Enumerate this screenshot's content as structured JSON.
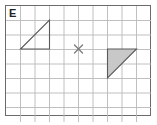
{
  "figure": {
    "label": "E",
    "background_color": "#ffffff",
    "border_color": "#6b6b6b",
    "grid_line_color": "#b9b9b9",
    "shape_stroke_color": "#5a5a5a",
    "shaded_fill_color": "#c8c8c8",
    "marker_color": "#7a7a7a"
  },
  "chart_data": {
    "type": "scatter",
    "title": "E",
    "xlabel": "",
    "ylabel": "",
    "grid": true,
    "legend": "none",
    "xlim": [
      0,
      10
    ],
    "ylim": [
      0,
      8
    ],
    "grid_columns": 10,
    "grid_rows": 8,
    "cell_size_px": 14.5,
    "plot_origin_px": [
      6,
      6
    ],
    "annotations": [
      {
        "name": "panel-label",
        "text": "E",
        "position_px": [
          9,
          7
        ]
      }
    ],
    "series": [
      {
        "name": "unfilled-triangle",
        "type": "polygon",
        "filled": false,
        "stroke": "#5a5a5a",
        "vertices_grid": [
          [
            1,
            3
          ],
          [
            3,
            1
          ],
          [
            3,
            3
          ]
        ],
        "vertices_px": [
          [
            20.5,
            49
          ],
          [
            49.5,
            20
          ],
          [
            49.5,
            49
          ]
        ]
      },
      {
        "name": "shaded-triangle",
        "type": "polygon",
        "filled": true,
        "fill": "#c8c8c8",
        "stroke": "#5a5a5a",
        "vertices_grid": [
          [
            7,
            3
          ],
          [
            9,
            3
          ],
          [
            7,
            5
          ]
        ],
        "vertices_px": [
          [
            107.5,
            49
          ],
          [
            136.5,
            49
          ],
          [
            107.5,
            78
          ]
        ]
      },
      {
        "name": "center-marker",
        "type": "marker",
        "symbol": "x",
        "stroke": "#7a7a7a",
        "vertices_grid": [
          [
            5,
            3
          ]
        ],
        "vertices_px": [
          [
            78.5,
            49
          ]
        ],
        "size_px": 8
      }
    ]
  }
}
